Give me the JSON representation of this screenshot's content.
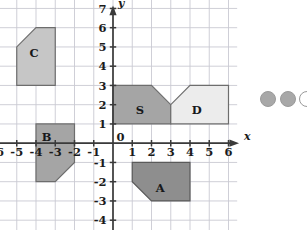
{
  "figure": {
    "type": "coordinate-grid-shapes",
    "background_color": "#ffffff",
    "grid_line_color": "#c9c9d2",
    "axis_color": "#3a3a3a",
    "axis_labels": {
      "x": "x",
      "y": "y"
    },
    "x_axis": {
      "min": -6,
      "max": 6,
      "ticks": [
        -6,
        -5,
        -4,
        -3,
        -2,
        -1,
        0,
        1,
        2,
        3,
        4,
        5,
        6
      ],
      "tick_labels": [
        "-6",
        "-5",
        "-4",
        "-3",
        "-2",
        "-1",
        "0",
        "1",
        "2",
        "3",
        "4",
        "5",
        "6"
      ]
    },
    "y_axis": {
      "min": -5,
      "max": 7,
      "ticks": [
        7,
        6,
        5,
        4,
        3,
        2,
        1,
        0,
        -1,
        -2,
        -3,
        -4,
        -5
      ],
      "tick_labels": [
        "7",
        "6",
        "5",
        "4",
        "3",
        "2",
        "1",
        "0",
        "-1",
        "-2",
        "-3",
        "-4",
        "-5"
      ]
    },
    "origin_label": "0"
  },
  "chart_data": {
    "type": "scatter",
    "title": "",
    "xlabel": "x",
    "ylabel": "y",
    "xlim": [
      -6,
      6
    ],
    "ylim": [
      -5,
      7
    ],
    "grid": true,
    "legend": "none",
    "shapes": [
      {
        "label": "C",
        "fill": "#c6c6c6",
        "stroke": "#6d6d6d",
        "label_point": [
          -4.1,
          4.7
        ],
        "vertices": [
          [
            -5,
            3
          ],
          [
            -5,
            5
          ],
          [
            -4,
            6
          ],
          [
            -3,
            6
          ],
          [
            -3,
            3
          ]
        ]
      },
      {
        "label": "B",
        "fill": "#a5a5a5",
        "stroke": "#6d6d6d",
        "label_point": [
          -3.45,
          0.35
        ],
        "vertices": [
          [
            -4,
            1
          ],
          [
            -2,
            1
          ],
          [
            -2,
            -1
          ],
          [
            -3,
            -2
          ],
          [
            -4,
            -2
          ]
        ]
      },
      {
        "label": "S",
        "fill": "#a5a5a5",
        "stroke": "#6d6d6d",
        "label_point": [
          1.4,
          1.75
        ],
        "vertices": [
          [
            0,
            1
          ],
          [
            0,
            3
          ],
          [
            2,
            3
          ],
          [
            3,
            2
          ],
          [
            3,
            1
          ]
        ]
      },
      {
        "label": "D",
        "fill": "#ececec",
        "stroke": "#6d6d6d",
        "label_point": [
          4.35,
          1.75
        ],
        "vertices": [
          [
            3,
            1
          ],
          [
            3,
            2
          ],
          [
            4,
            3
          ],
          [
            6,
            3
          ],
          [
            6,
            1
          ]
        ]
      },
      {
        "label": "A",
        "fill": "#8e8e8e",
        "stroke": "#5a5a5a",
        "label_point": [
          2.45,
          -2.3
        ],
        "vertices": [
          [
            1,
            -1
          ],
          [
            4,
            -1
          ],
          [
            4,
            -3
          ],
          [
            2,
            -3
          ],
          [
            1,
            -2
          ]
        ]
      }
    ]
  },
  "decor": {
    "dots_color": "#a8a8a8",
    "dots_outline": "#9a9a9a",
    "dots": [
      {
        "cx": 268,
        "cy": 99,
        "r": 7.5,
        "filled": true
      },
      {
        "cx": 288,
        "cy": 99,
        "r": 7.5,
        "filled": true
      },
      {
        "cx": 307,
        "cy": 99,
        "r": 7.5,
        "filled": false
      }
    ]
  }
}
